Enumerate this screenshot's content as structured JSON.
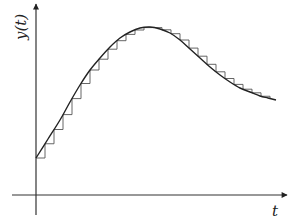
{
  "figure": {
    "y_axis_label": "y(t)",
    "x_axis_label": "t",
    "colors": {
      "background": "#ffffff",
      "axes": "#333333",
      "curve": "#222222",
      "steps": "#555555"
    }
  },
  "chart_data": {
    "type": "line",
    "title": "",
    "xlabel": "t",
    "ylabel": "y(t)",
    "grid": false,
    "legend": "none",
    "axes_pixel": {
      "origin": [
        36,
        195
      ],
      "x_axis": {
        "from": 12,
        "to": 287,
        "y": 195
      },
      "y_axis": {
        "from": 215,
        "to": 4,
        "x": 36
      }
    },
    "series": [
      {
        "name": "y(t) continuous",
        "style": "smooth-curve",
        "points_px": [
          [
            36,
            158
          ],
          [
            48,
            139
          ],
          [
            60,
            120
          ],
          [
            70,
            102
          ],
          [
            80,
            85
          ],
          [
            90,
            70
          ],
          [
            100,
            58
          ],
          [
            110,
            47
          ],
          [
            120,
            38
          ],
          [
            130,
            32
          ],
          [
            140,
            28
          ],
          [
            150,
            27
          ],
          [
            160,
            29
          ],
          [
            170,
            33
          ],
          [
            180,
            40
          ],
          [
            190,
            49
          ],
          [
            200,
            58
          ],
          [
            210,
            67
          ],
          [
            220,
            75
          ],
          [
            230,
            82
          ],
          [
            240,
            88
          ],
          [
            250,
            92
          ],
          [
            260,
            96
          ],
          [
            268,
            98
          ],
          [
            276,
            100
          ]
        ]
      },
      {
        "name": "y(t) zero-order hold",
        "style": "staircase",
        "sample_step_px": 9,
        "sample_x_start": 36,
        "sample_x_end": 270
      }
    ]
  }
}
